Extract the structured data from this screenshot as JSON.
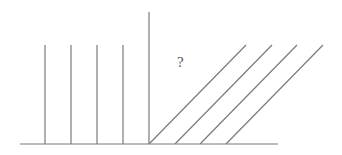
{
  "diagram": {
    "label": "?",
    "line_color": "#7a7a7a",
    "baseline": {
      "x1": 20,
      "y1": 144,
      "x2": 278,
      "y2": 144
    },
    "axis": {
      "x1": 149,
      "y1": 12,
      "x2": 149,
      "y2": 144
    },
    "verticals": [
      {
        "x1": 45,
        "y1": 45,
        "x2": 45,
        "y2": 144
      },
      {
        "x1": 71,
        "y1": 45,
        "x2": 71,
        "y2": 144
      },
      {
        "x1": 97,
        "y1": 45,
        "x2": 97,
        "y2": 144
      },
      {
        "x1": 123,
        "y1": 45,
        "x2": 123,
        "y2": 144
      }
    ],
    "diagonals": [
      {
        "x1": 149,
        "y1": 144,
        "x2": 246,
        "y2": 45
      },
      {
        "x1": 175,
        "y1": 144,
        "x2": 272,
        "y2": 45
      },
      {
        "x1": 200,
        "y1": 144,
        "x2": 297,
        "y2": 45
      },
      {
        "x1": 226,
        "y1": 144,
        "x2": 323,
        "y2": 45
      }
    ]
  }
}
